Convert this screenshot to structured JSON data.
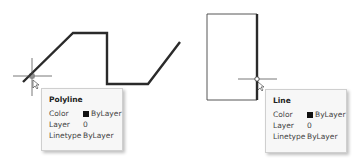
{
  "drawing": {
    "polyline_points": "23,82 73,33 107,33 107,84 148,84 180,42",
    "rectangle": {
      "x": 207,
      "y": 14,
      "width": 50,
      "height": 86
    },
    "line_color": "#2a2a2a"
  },
  "tooltips": [
    {
      "title": "Polyline",
      "rows": [
        {
          "key": "Color",
          "value": "ByLayer",
          "swatch": "#111111"
        },
        {
          "key": "Layer",
          "value": "0"
        },
        {
          "key": "Linetype",
          "value": "ByLayer"
        }
      ]
    },
    {
      "title": "Line",
      "rows": [
        {
          "key": "Color",
          "value": "ByLayer",
          "swatch": "#111111"
        },
        {
          "key": "Layer",
          "value": "0"
        },
        {
          "key": "Linetype",
          "value": "ByLayer"
        }
      ]
    }
  ]
}
